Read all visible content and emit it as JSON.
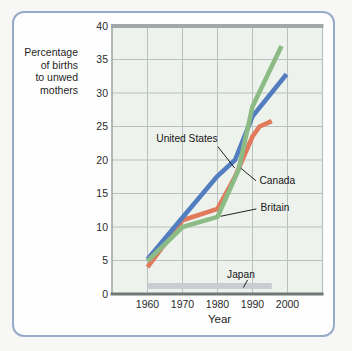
{
  "chart_data": {
    "type": "line",
    "title": "",
    "ylabel": "Percentage of births to unwed mothers",
    "ylabel_lines": [
      "Percentage",
      "of births",
      "to unwed",
      "mothers"
    ],
    "xlabel": "Year",
    "x_ticks": [
      "1960",
      "1970",
      "1980",
      "1990",
      "2000"
    ],
    "x_tick_years": [
      1960,
      1970,
      1980,
      1990,
      2000
    ],
    "y_ticks": [
      40,
      35,
      30,
      25,
      20,
      15,
      10,
      5,
      0
    ],
    "ylim": [
      0,
      40
    ],
    "xlim": [
      1950,
      2010
    ],
    "grid": true,
    "legend_position": "inline-annotations",
    "series": [
      {
        "name": "United States",
        "color": "#527ec0",
        "width": 4.6,
        "z": 2,
        "points": [
          [
            1960,
            5.2
          ],
          [
            1970,
            11.4
          ],
          [
            1980,
            17.6
          ],
          [
            1985,
            20.0
          ],
          [
            1990,
            26.5
          ],
          [
            1999.7,
            32.8
          ]
        ]
      },
      {
        "name": "Canada",
        "color": "#e07a5b",
        "width": 4.6,
        "z": 1,
        "points": [
          [
            1960,
            4.0
          ],
          [
            1970,
            11.0
          ],
          [
            1980,
            12.7
          ],
          [
            1985,
            17.5
          ],
          [
            1990,
            23.5
          ],
          [
            1992,
            25.0
          ],
          [
            1995.5,
            25.8
          ]
        ]
      },
      {
        "name": "Britain",
        "color": "#8cbb86",
        "width": 4.6,
        "z": 3,
        "points": [
          [
            1960,
            4.9
          ],
          [
            1970,
            10.0
          ],
          [
            1980,
            11.5
          ],
          [
            1986,
            18.5
          ],
          [
            1990,
            28.0
          ],
          [
            1998.3,
            37.0
          ]
        ]
      },
      {
        "name": "Japan",
        "color": "#c9cdd2",
        "width": 6,
        "z": 0,
        "points": [
          [
            1960,
            1.2
          ],
          [
            1995.5,
            1.2
          ]
        ]
      }
    ],
    "annotations": [
      {
        "text": "United States",
        "align": "right",
        "year": 1980.0,
        "value": 23.2,
        "pointer": [
          [
            1980.1,
            22.0
          ],
          [
            1984.9,
            18.8
          ]
        ]
      },
      {
        "text": "Canada",
        "align": "left",
        "year": 1991.7,
        "value": 16.9,
        "pointer": [
          [
            1991.0,
            16.9
          ],
          [
            1986.6,
            18.8
          ]
        ]
      },
      {
        "text": "Britain",
        "align": "left",
        "year": 1992.0,
        "value": 12.9,
        "pointer": [
          [
            1991.1,
            12.7
          ],
          [
            1980.9,
            11.6
          ]
        ]
      },
      {
        "text": "Japan",
        "align": "center",
        "year": 1986.7,
        "value": 2.8,
        "pointer": [
          [
            1988.6,
            2.1
          ],
          [
            1987.4,
            0.95
          ]
        ]
      }
    ]
  },
  "colors": {
    "page_bg": "#f7f7f5",
    "card_bg": "#fefefe",
    "card_border": "#97abc9",
    "plot_bg": "#edf2ed",
    "grid": "#b9c1c0",
    "plot_top_border": "#a2a8a7",
    "plot_left_border": "#9aa2a1",
    "axis": "#6f7875",
    "pointer_line": "#222222",
    "text": "#1f1f1f"
  }
}
